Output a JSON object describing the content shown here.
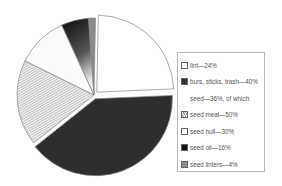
{
  "chart_data": {
    "type": "pie",
    "title": "",
    "slices": [
      {
        "label": "lint",
        "value": 24,
        "legend": "lint—24%",
        "fill": "#ffffff",
        "exploded": true
      },
      {
        "label": "burs, sticks, trash",
        "value": 40,
        "legend": "burs, sticks, trash—40%",
        "fill": "#2e2e2e",
        "exploded": true
      },
      {
        "label": "seed meal",
        "value": 18,
        "legend": "seed meal—50%",
        "fill": "hatch",
        "parent": "seed"
      },
      {
        "label": "seed hull",
        "value": 10.8,
        "legend": "seed hull—30%",
        "fill": "#fbfbfb",
        "parent": "seed"
      },
      {
        "label": "seed oil",
        "value": 5.76,
        "legend": "seed oil—16%",
        "fill": "#111111",
        "parent": "seed"
      },
      {
        "label": "seed linters",
        "value": 1.44,
        "legend": "seed linters—4%",
        "fill": "#8a8a8a",
        "parent": "seed"
      }
    ],
    "groups": [
      {
        "label": "seed",
        "value": 36,
        "legend": "seed—36%, of which"
      }
    ],
    "legend_position": "right"
  },
  "legend": {
    "items": [
      {
        "text": "lint—24%",
        "swatch": "#ffffff"
      },
      {
        "text": "burs, sticks, trash—40%",
        "swatch": "#2e2e2e"
      },
      {
        "text": "seed—36%, of which",
        "swatch": null
      },
      {
        "text": "seed meal—50%",
        "swatch": "#d8d8d8"
      },
      {
        "text": "seed hull—30%",
        "swatch": "#ffffff"
      },
      {
        "text": "seed oil—16%",
        "swatch": "#111111"
      },
      {
        "text": "seed linters—4%",
        "swatch": "#8a8a8a"
      }
    ]
  }
}
